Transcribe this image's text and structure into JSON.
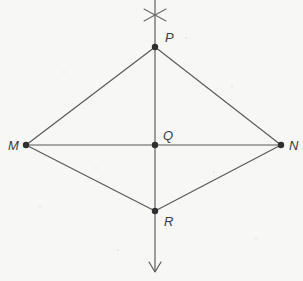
{
  "figure": {
    "background_color": "#f7f7f6",
    "line_color": "#585858",
    "dot_color": "#2f2f2f",
    "label_color": "#3a3a3a",
    "canvas": {
      "width": 303,
      "height": 281
    }
  },
  "points": {
    "P": {
      "label": "P",
      "x": 155,
      "y": 47,
      "label_x": 165,
      "label_y": 42
    },
    "M": {
      "label": "M",
      "x": 26,
      "y": 145,
      "label_x": 8,
      "label_y": 150
    },
    "Q": {
      "label": "Q",
      "x": 155,
      "y": 145,
      "label_x": 163,
      "label_y": 140
    },
    "N": {
      "label": "N",
      "x": 281,
      "y": 145,
      "label_x": 289,
      "label_y": 150
    },
    "R": {
      "label": "R",
      "x": 155,
      "y": 211,
      "label_x": 164,
      "label_y": 226
    }
  },
  "segments": [
    {
      "name": "MP",
      "x1": 26,
      "y1": 145,
      "x2": 155,
      "y2": 47
    },
    {
      "name": "PN",
      "x1": 155,
      "y1": 47,
      "x2": 281,
      "y2": 145
    },
    {
      "name": "MR",
      "x1": 26,
      "y1": 145,
      "x2": 155,
      "y2": 211
    },
    {
      "name": "RN",
      "x1": 155,
      "y1": 211,
      "x2": 281,
      "y2": 145
    },
    {
      "name": "MN",
      "x1": 26,
      "y1": 145,
      "x2": 281,
      "y2": 145
    }
  ],
  "vertical_line": {
    "name": "PR-axis",
    "x1": 155,
    "y1": 0,
    "x2": 155,
    "y2": 272
  },
  "arrow": {
    "name": "downward-arrowhead",
    "tip_x": 155,
    "tip_y": 272,
    "left_x": 149,
    "left_y": 262,
    "right_x": 161,
    "right_y": 262
  },
  "arc_cross": {
    "name": "compass-arc-intersection",
    "center_x": 155,
    "center_y": 15,
    "stroke_a": {
      "x1": 144,
      "y1": 9,
      "x2": 166,
      "y2": 21
    },
    "stroke_b": {
      "x1": 144,
      "y1": 21,
      "x2": 166,
      "y2": 9
    }
  },
  "dot_radius": 3.2
}
